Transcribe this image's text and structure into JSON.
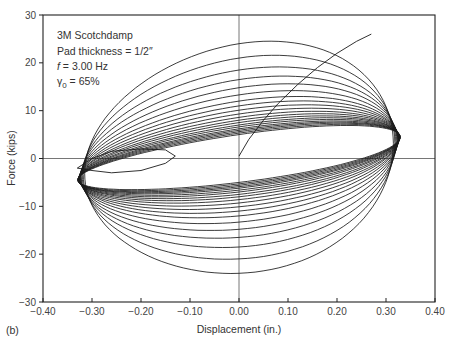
{
  "chart_data": {
    "type": "line",
    "title": "",
    "panel_label": "(b)",
    "xlabel": "Displacement (in.)",
    "ylabel": "Force (kips)",
    "xlim": [
      -0.4,
      0.4
    ],
    "ylim": [
      -30,
      30
    ],
    "xticks": [
      -0.4,
      -0.3,
      -0.2,
      -0.1,
      0.0,
      0.1,
      0.2,
      0.3,
      0.4
    ],
    "xtick_labels": [
      "−0.40",
      "−0.30",
      "−0.20",
      "−0.10",
      "0.00",
      "0.10",
      "0.20",
      "0.30",
      "0.40"
    ],
    "yticks": [
      30,
      20,
      10,
      0,
      -10,
      -20,
      -30
    ],
    "ytick_labels": [
      "30",
      "20",
      "10",
      "0",
      "−10",
      "−20",
      "−30"
    ],
    "zero_lines": true,
    "grid": false,
    "annotations": [
      "3M Scotchdamp",
      "Pad thickness = 1/2″",
      "f = 3.00 Hz",
      "γ0 = 65%"
    ],
    "loops": {
      "center_x": 0.0,
      "amplitude_x": [
        0.315,
        0.318,
        0.32,
        0.322,
        0.323,
        0.324,
        0.325,
        0.325,
        0.326,
        0.326,
        0.327,
        0.327,
        0.327,
        0.328,
        0.328,
        0.328,
        0.328,
        0.329,
        0.329,
        0.329
      ],
      "stiffness_kips_per_in": [
        10,
        10.5,
        11,
        11.5,
        12,
        12.2,
        12.4,
        12.6,
        12.8,
        13,
        13,
        13.2,
        13.2,
        13.4,
        13.4,
        13.5,
        13.5,
        13.6,
        13.6,
        13.6
      ],
      "loss_amplitude_kips": [
        24,
        21,
        18.5,
        16.5,
        14.8,
        13.3,
        12,
        11,
        10.1,
        9.3,
        8.6,
        8.0,
        7.5,
        7.0,
        6.6,
        6.2,
        5.9,
        5.6,
        5.3,
        5.0
      ]
    },
    "initial_curve": {
      "x": [
        0.0,
        0.02,
        0.05,
        0.08,
        0.12,
        0.16,
        0.2,
        0.24,
        0.27
      ],
      "y": [
        0.5,
        4,
        8,
        11.5,
        15.5,
        19,
        22,
        24.5,
        26
      ]
    },
    "transient_loop": {
      "x": [
        -0.33,
        -0.3,
        -0.26,
        -0.2,
        -0.15,
        -0.13,
        -0.15,
        -0.2,
        -0.26,
        -0.3
      ],
      "y": [
        -2,
        0,
        1.5,
        2,
        1.8,
        0.5,
        -1,
        -2.5,
        -3,
        -2.5
      ]
    },
    "colors": {
      "line": "#1a1a1a",
      "axis": "#222222",
      "zero_line": "#666666"
    }
  }
}
